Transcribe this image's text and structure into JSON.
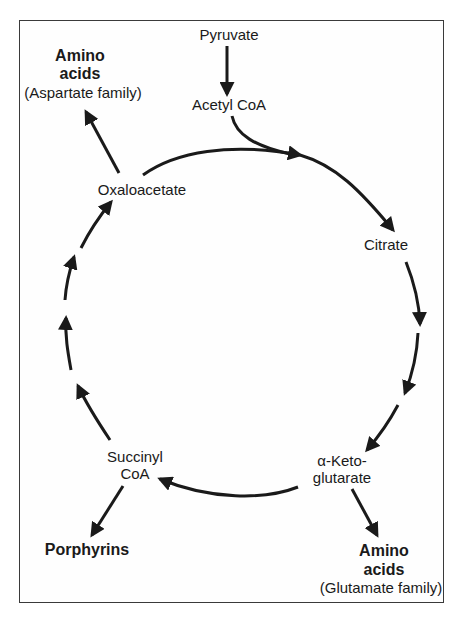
{
  "diagram": {
    "type": "metabolic-cycle",
    "colors": {
      "stroke": "#1a1a1a",
      "frame": "#3a3a3a",
      "background": "#ffffff"
    },
    "inputs": {
      "pyruvate": "Pyruvate",
      "acetyl_coa": "Acetyl CoA"
    },
    "cycle_nodes": {
      "citrate": "Citrate",
      "alpha_ketoglutarate_line1": "α-Keto-",
      "alpha_ketoglutarate_line2": "glutarate",
      "succinyl_coa_line1": "Succinyl",
      "succinyl_coa_line2": "CoA",
      "oxaloacetate": "Oxaloacetate"
    },
    "outputs": {
      "aspartate": {
        "line1": "Amino",
        "line2": "acids",
        "line3": "(Aspartate family)"
      },
      "glutamate": {
        "line1": "Amino",
        "line2": "acids",
        "line3": "(Glutamate family)"
      },
      "porphyrins": "Porphyrins"
    },
    "edges": [
      {
        "from": "Pyruvate",
        "to": "Acetyl CoA"
      },
      {
        "from": "Acetyl CoA",
        "to": "Citrate"
      },
      {
        "from": "Oxaloacetate",
        "to": "Citrate"
      },
      {
        "from": "Citrate",
        "to": "α-Ketoglutarate"
      },
      {
        "from": "α-Ketoglutarate",
        "to": "Succinyl CoA"
      },
      {
        "from": "Succinyl CoA",
        "to": "Oxaloacetate"
      },
      {
        "from": "Oxaloacetate",
        "to": "Amino acids (Aspartate family)"
      },
      {
        "from": "α-Ketoglutarate",
        "to": "Amino acids (Glutamate family)"
      },
      {
        "from": "Succinyl CoA",
        "to": "Porphyrins"
      }
    ]
  }
}
